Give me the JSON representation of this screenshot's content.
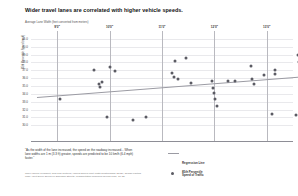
{
  "chart_data": {
    "type": "scatter",
    "title": "Wider travel lanes are correlated with higher vehicle speeds.",
    "axis_note": "Average Lane Width (feet converted from meters)",
    "xlabel": "",
    "ylabel": "85th Percentile Speed (mph)",
    "xlim": [
      8.5,
      13.5
    ],
    "ylim": [
      28.0,
      42.0
    ],
    "grid": true,
    "legend_position": "bottom-right",
    "xtick_labels": [
      "9'0\"",
      "10'0\"",
      "11'0\"",
      "12'0\"",
      "13'0\"",
      "14'0\""
    ],
    "xtick_values": [
      9,
      10,
      11,
      12,
      13,
      14
    ],
    "ytick_labels": [
      "41.0",
      "40.0",
      "39.0",
      "38.0",
      "37.0",
      "36.0",
      "35.0",
      "34.0",
      "33.0",
      "32.0",
      "31.0",
      "30.0"
    ],
    "ytick_values": [
      41,
      40,
      39,
      38,
      37,
      36,
      35,
      34,
      33,
      32,
      31,
      30
    ],
    "series": [
      {
        "name": "85th Percentile Speed of Traffic",
        "marker": "circle",
        "color": "#5b5b63",
        "points": [
          [
            9.05,
            33.3
          ],
          [
            9.85,
            35.5
          ],
          [
            9.8,
            35.2
          ],
          [
            9.82,
            34.9
          ],
          [
            9.7,
            37.0
          ],
          [
            10.0,
            37.4
          ],
          [
            10.1,
            36.9
          ],
          [
            9.95,
            31.0
          ],
          [
            10.45,
            30.7
          ],
          [
            10.7,
            31.0
          ],
          [
            11.25,
            38.2
          ],
          [
            11.2,
            36.6
          ],
          [
            11.22,
            36.2
          ],
          [
            11.3,
            35.9
          ],
          [
            11.45,
            38.6
          ],
          [
            11.55,
            35.4
          ],
          [
            11.95,
            35.7
          ],
          [
            11.98,
            34.8
          ],
          [
            12.0,
            34.1
          ],
          [
            12.02,
            33.4
          ],
          [
            12.05,
            32.4
          ],
          [
            12.25,
            35.6
          ],
          [
            12.4,
            35.6
          ],
          [
            12.7,
            37.6
          ],
          [
            12.72,
            35.9
          ],
          [
            12.75,
            35.3
          ],
          [
            12.95,
            36.4
          ],
          [
            13.15,
            37.1
          ],
          [
            13.16,
            36.5
          ],
          [
            13.1,
            31.5
          ],
          [
            13.6,
            39.0
          ],
          [
            13.62,
            38.1
          ],
          [
            13.55,
            31.3
          ],
          [
            14.05,
            35.2
          ],
          [
            14.3,
            35.2
          ]
        ]
      }
    ],
    "regression": {
      "name": "Regression Line",
      "color": "#9b9ba3",
      "x_start": 8.62,
      "y_start": 33.6,
      "x_end": 14.45,
      "y_end": 36.6
    },
    "legend": [
      {
        "label": "Regression Line",
        "marker": "line"
      },
      {
        "label": "85th Percentile\nSpeed of Traffic",
        "marker": "dot"
      }
    ],
    "quote": "“As the width of the lane increased, the speed on the roadway increased... When lane widths are 1 m (3.3 ft) greater, speeds are predicted to be 10 km/h (6.4 mph) faster.”",
    "source": "Chief Vaccine President; New Trial Cultures; Various Speed Limit Width Relationships (2012); 'Design Factors Than Affect Driver Speed on Suburban Streets'; Transportation Research Record 1751, 18–25"
  }
}
